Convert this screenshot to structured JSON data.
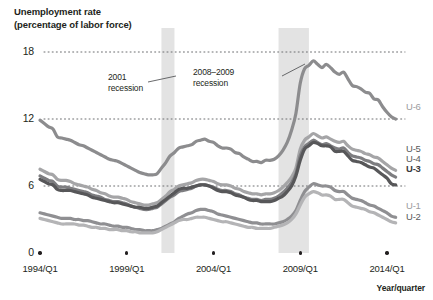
{
  "chart_data": {
    "type": "line",
    "title": "Unemployment rate",
    "subtitle": "(percentage of labor force)",
    "xlabel": "Year/quarter",
    "ylabel": "",
    "ylim": [
      0,
      18
    ],
    "yticks": [
      0,
      6,
      12,
      18
    ],
    "ytick_labels": [
      "0",
      "6",
      "12",
      "18"
    ],
    "xlim": [
      1994.0,
      2014.75
    ],
    "xticks": [
      1994.0,
      1999.0,
      2004.0,
      2009.0,
      2014.0
    ],
    "xtick_labels": [
      "1994/Q1",
      "1999/Q1",
      "2004/Q1",
      "2009/Q1",
      "2014/Q1"
    ],
    "grid": "horizontal-dotted",
    "legend_position": "right-inline",
    "annotations": [
      {
        "name": "recession-2001",
        "line1": "2001",
        "line2": "recession",
        "x_start": 2001.0,
        "x_end": 2001.75
      },
      {
        "name": "recession-2008-2009",
        "line1": "2008–2009",
        "line2": "recession",
        "x_start": 2007.75,
        "x_end": 2009.5
      }
    ],
    "shaded_bands": [
      {
        "label": "2001 recession",
        "x_start": 2001.0,
        "x_end": 2001.75,
        "color": "#e3e3e3"
      },
      {
        "label": "2008–2009 recession",
        "x_start": 2007.75,
        "x_end": 2009.5,
        "color": "#e3e3e3"
      }
    ],
    "x": [
      1994.0,
      1994.25,
      1994.5,
      1994.75,
      1995.0,
      1995.25,
      1995.5,
      1995.75,
      1996.0,
      1996.25,
      1996.5,
      1996.75,
      1997.0,
      1997.25,
      1997.5,
      1997.75,
      1998.0,
      1998.25,
      1998.5,
      1998.75,
      1999.0,
      1999.25,
      1999.5,
      1999.75,
      2000.0,
      2000.25,
      2000.5,
      2000.75,
      2001.0,
      2001.25,
      2001.5,
      2001.75,
      2002.0,
      2002.25,
      2002.5,
      2002.75,
      2003.0,
      2003.25,
      2003.5,
      2003.75,
      2004.0,
      2004.25,
      2004.5,
      2004.75,
      2005.0,
      2005.25,
      2005.5,
      2005.75,
      2006.0,
      2006.25,
      2006.5,
      2006.75,
      2007.0,
      2007.25,
      2007.5,
      2007.75,
      2008.0,
      2008.25,
      2008.5,
      2008.75,
      2009.0,
      2009.25,
      2009.5,
      2009.75,
      2010.0,
      2010.25,
      2010.5,
      2010.75,
      2011.0,
      2011.25,
      2011.5,
      2011.75,
      2012.0,
      2012.25,
      2012.5,
      2012.75,
      2013.0,
      2013.25,
      2013.5,
      2013.75,
      2014.0,
      2014.25,
      2014.5
    ],
    "series": [
      {
        "name": "U-6",
        "color": "#8c8c8e",
        "label_color": "#8c8c8e",
        "values": [
          11.9,
          11.6,
          11.3,
          11.1,
          10.4,
          10.3,
          10.2,
          10.1,
          9.9,
          9.7,
          9.6,
          9.4,
          9.2,
          9.0,
          8.8,
          8.6,
          8.4,
          8.3,
          8.2,
          8.0,
          7.8,
          7.6,
          7.4,
          7.2,
          7.1,
          7.0,
          7.0,
          7.1,
          7.6,
          8.1,
          8.7,
          9.0,
          9.4,
          9.5,
          9.6,
          9.7,
          10.0,
          10.1,
          10.2,
          10.0,
          9.9,
          9.6,
          9.4,
          9.4,
          9.3,
          9.0,
          8.9,
          8.6,
          8.4,
          8.2,
          8.2,
          8.1,
          8.3,
          8.3,
          8.4,
          8.7,
          9.2,
          9.9,
          11.0,
          12.5,
          15.2,
          16.5,
          16.8,
          17.2,
          16.9,
          16.6,
          16.9,
          16.6,
          16.2,
          16.0,
          16.2,
          15.6,
          15.0,
          14.9,
          14.7,
          14.4,
          14.3,
          13.8,
          13.7,
          13.1,
          12.6,
          12.2,
          12.0
        ]
      },
      {
        "name": "U-5",
        "color": "#a5a5a7",
        "label_color": "#a5a5a7",
        "values": [
          7.5,
          7.3,
          7.1,
          7.0,
          6.6,
          6.5,
          6.5,
          6.4,
          6.2,
          6.1,
          6.0,
          5.9,
          5.7,
          5.6,
          5.4,
          5.3,
          5.1,
          5.0,
          5.0,
          4.9,
          4.8,
          4.6,
          4.5,
          4.4,
          4.3,
          4.3,
          4.4,
          4.5,
          4.8,
          5.1,
          5.5,
          5.7,
          6.0,
          6.1,
          6.2,
          6.3,
          6.5,
          6.6,
          6.6,
          6.5,
          6.4,
          6.2,
          6.1,
          6.1,
          6.0,
          5.8,
          5.7,
          5.5,
          5.4,
          5.3,
          5.3,
          5.2,
          5.3,
          5.3,
          5.4,
          5.6,
          5.9,
          6.3,
          6.8,
          7.6,
          9.3,
          10.1,
          10.4,
          10.7,
          10.5,
          10.3,
          10.4,
          10.2,
          10.0,
          9.9,
          10.0,
          9.6,
          9.3,
          9.2,
          9.1,
          8.9,
          8.8,
          8.6,
          8.5,
          8.2,
          7.9,
          7.6,
          7.4
        ]
      },
      {
        "name": "U-4",
        "color": "#7d7d80",
        "label_color": "#7d7d80",
        "values": [
          6.9,
          6.7,
          6.5,
          6.4,
          6.0,
          5.9,
          5.9,
          5.8,
          5.7,
          5.6,
          5.5,
          5.4,
          5.2,
          5.1,
          5.0,
          4.8,
          4.7,
          4.6,
          4.6,
          4.5,
          4.4,
          4.2,
          4.1,
          4.0,
          3.9,
          3.9,
          4.0,
          4.1,
          4.4,
          4.7,
          5.0,
          5.2,
          5.5,
          5.6,
          5.7,
          5.8,
          6.0,
          6.1,
          6.1,
          6.0,
          5.9,
          5.7,
          5.6,
          5.6,
          5.5,
          5.3,
          5.2,
          5.0,
          4.9,
          4.8,
          4.8,
          4.7,
          4.8,
          4.8,
          4.9,
          5.1,
          5.4,
          5.8,
          6.3,
          7.1,
          8.7,
          9.5,
          9.8,
          10.1,
          9.9,
          9.7,
          9.8,
          9.6,
          9.4,
          9.3,
          9.4,
          9.0,
          8.7,
          8.6,
          8.5,
          8.3,
          8.2,
          8.0,
          7.9,
          7.6,
          7.3,
          7.0,
          6.8
        ]
      },
      {
        "name": "U-3",
        "color": "#575759",
        "label_color": "#3a3a3c",
        "values": [
          6.6,
          6.4,
          6.2,
          6.1,
          5.7,
          5.6,
          5.6,
          5.6,
          5.5,
          5.4,
          5.3,
          5.2,
          5.0,
          4.9,
          4.8,
          4.7,
          4.6,
          4.5,
          4.5,
          4.4,
          4.3,
          4.2,
          4.1,
          4.1,
          4.0,
          4.0,
          4.1,
          4.2,
          4.5,
          4.8,
          5.1,
          5.4,
          5.7,
          5.8,
          5.8,
          5.9,
          6.0,
          6.1,
          6.1,
          6.0,
          5.8,
          5.6,
          5.5,
          5.5,
          5.4,
          5.2,
          5.1,
          5.0,
          4.8,
          4.7,
          4.7,
          4.6,
          4.6,
          4.6,
          4.7,
          4.9,
          5.1,
          5.5,
          6.0,
          6.9,
          8.3,
          9.3,
          9.6,
          9.9,
          9.8,
          9.6,
          9.6,
          9.5,
          9.1,
          9.1,
          9.1,
          8.7,
          8.3,
          8.2,
          8.1,
          7.9,
          7.7,
          7.6,
          7.3,
          7.0,
          6.7,
          6.2,
          6.1
        ]
      },
      {
        "name": "U-1",
        "color": "#8f8f92",
        "label_color": "#9b9b9e",
        "values": [
          3.6,
          3.5,
          3.4,
          3.3,
          3.2,
          3.1,
          3.1,
          3.1,
          3.0,
          3.0,
          2.9,
          2.9,
          2.8,
          2.7,
          2.6,
          2.6,
          2.5,
          2.4,
          2.4,
          2.3,
          2.3,
          2.2,
          2.1,
          2.1,
          2.0,
          2.0,
          2.0,
          2.1,
          2.2,
          2.4,
          2.6,
          2.8,
          3.1,
          3.3,
          3.5,
          3.6,
          3.8,
          3.9,
          3.9,
          3.8,
          3.7,
          3.5,
          3.4,
          3.3,
          3.2,
          3.1,
          3.0,
          2.9,
          2.8,
          2.7,
          2.7,
          2.6,
          2.6,
          2.6,
          2.6,
          2.7,
          2.8,
          3.0,
          3.3,
          3.8,
          4.7,
          5.5,
          5.9,
          6.2,
          6.1,
          6.0,
          6.0,
          5.9,
          5.6,
          5.5,
          5.5,
          5.2,
          4.9,
          4.8,
          4.7,
          4.5,
          4.3,
          4.2,
          4.0,
          3.8,
          3.6,
          3.3,
          3.2
        ]
      },
      {
        "name": "U-2",
        "color": "#b4b4b6",
        "label_color": "#9b9b9e",
        "values": [
          3.1,
          3.0,
          2.9,
          2.8,
          2.7,
          2.6,
          2.6,
          2.6,
          2.6,
          2.5,
          2.5,
          2.4,
          2.3,
          2.3,
          2.2,
          2.2,
          2.1,
          2.1,
          2.1,
          2.0,
          2.0,
          1.9,
          1.9,
          1.8,
          1.8,
          1.8,
          1.8,
          1.9,
          2.1,
          2.3,
          2.5,
          2.7,
          2.9,
          3.0,
          3.0,
          3.1,
          3.2,
          3.2,
          3.2,
          3.1,
          3.0,
          2.9,
          2.8,
          2.8,
          2.7,
          2.6,
          2.5,
          2.4,
          2.3,
          2.3,
          2.2,
          2.2,
          2.2,
          2.2,
          2.3,
          2.4,
          2.5,
          2.7,
          3.0,
          3.5,
          4.3,
          5.0,
          5.3,
          5.5,
          5.4,
          5.2,
          5.2,
          5.1,
          4.8,
          4.8,
          4.8,
          4.5,
          4.2,
          4.1,
          4.0,
          3.9,
          3.7,
          3.6,
          3.4,
          3.2,
          3.0,
          2.8,
          2.7
        ]
      }
    ]
  },
  "labels": {
    "title_line1": "Unemployment rate",
    "title_line2": "(percentage of labor force)",
    "y0": "0",
    "y6": "6",
    "y12": "12",
    "y18": "18",
    "x1994": "1994/Q1",
    "x1999": "1999/Q1",
    "x2004": "2004/Q1",
    "x2009": "2009/Q1",
    "x2014": "2014/Q1",
    "x_axis_title": "Year/quarter",
    "series_u6": "U-6",
    "series_u5": "U-5",
    "series_u4": "U-4",
    "series_u3": "U-3",
    "series_u1": "U-1",
    "series_u2": "U-2",
    "ann1_line1": "2001",
    "ann1_line2": "recession",
    "ann2_line1": "2008–2009",
    "ann2_line2": "recession"
  }
}
